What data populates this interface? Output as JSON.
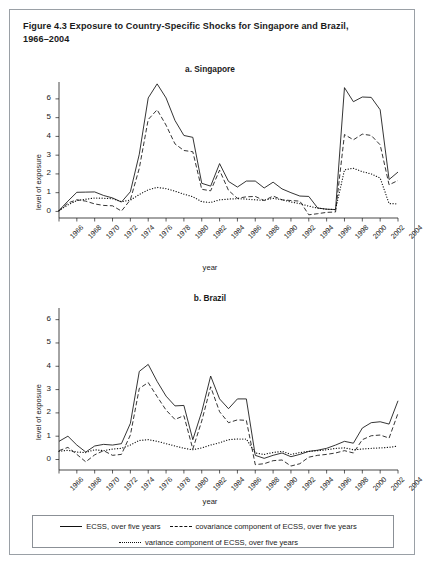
{
  "figure": {
    "title": "Figure 4.3  Exposure to Country-Specific Shocks for Singapore and Brazil, 1966–2004",
    "title_line1": "Figure 4.3  Exposure to Country-Specific Shocks for Singapore and Brazil,",
    "title_line2": "1966–2004"
  },
  "axis": {
    "xlabel": "year",
    "ylabel": "level of exposure",
    "yticks": [
      0,
      1,
      2,
      3,
      4,
      5,
      6
    ],
    "xticks": [
      1966,
      1968,
      1970,
      1972,
      1974,
      1976,
      1978,
      1980,
      1982,
      1984,
      1986,
      1988,
      1990,
      1992,
      1994,
      1996,
      1998,
      2000,
      2002,
      2004
    ]
  },
  "legend": {
    "items": [
      {
        "label": "ECSS, over five years",
        "style": "solid"
      },
      {
        "label": "covariance component of ECSS, over five years",
        "style": "dashed"
      },
      {
        "label": "variance component of ECSS, over five years",
        "style": "dotted"
      }
    ]
  },
  "chart_data": [
    {
      "type": "line",
      "title": "a. Singapore",
      "xlabel": "year",
      "ylabel": "level of exposure",
      "xlim": [
        1966,
        2004
      ],
      "ylim": [
        -0.35,
        6.9
      ],
      "grid": false,
      "legend_position": "below-figure",
      "x": [
        1966,
        1967,
        1968,
        1969,
        1970,
        1971,
        1972,
        1973,
        1974,
        1975,
        1976,
        1977,
        1978,
        1979,
        1980,
        1981,
        1982,
        1983,
        1984,
        1985,
        1986,
        1987,
        1988,
        1989,
        1990,
        1991,
        1992,
        1993,
        1994,
        1995,
        1996,
        1997,
        1998,
        1999,
        2000,
        2001,
        2002,
        2003,
        2004
      ],
      "series": [
        {
          "name": "ECSS, over five years",
          "style": "solid",
          "values": [
            0.05,
            0.55,
            1.02,
            1.03,
            1.04,
            0.85,
            0.72,
            0.5,
            1.05,
            3.05,
            6.05,
            6.8,
            6.05,
            4.85,
            4.05,
            3.95,
            1.5,
            1.35,
            2.55,
            1.6,
            1.3,
            1.62,
            1.62,
            1.25,
            1.56,
            1.2,
            1.0,
            0.82,
            0.8,
            0.18,
            0.12,
            0.1,
            6.6,
            5.85,
            6.1,
            6.08,
            5.42,
            1.7,
            2.1
          ]
        },
        {
          "name": "covariance component of ECSS, over five years",
          "style": "dashed",
          "values": [
            0.02,
            0.45,
            0.62,
            0.55,
            0.4,
            0.32,
            0.3,
            0.02,
            0.62,
            2.3,
            4.9,
            5.42,
            4.6,
            3.6,
            3.25,
            3.18,
            1.18,
            1.1,
            2.2,
            1.12,
            0.7,
            0.78,
            0.8,
            0.58,
            0.82,
            0.62,
            0.58,
            0.55,
            -0.18,
            -0.12,
            -0.05,
            -0.03,
            4.1,
            3.82,
            4.12,
            4.05,
            3.55,
            1.42,
            1.65
          ]
        },
        {
          "name": "variance component of ECSS, over five years",
          "style": "dotted",
          "values": [
            0.05,
            0.35,
            0.58,
            0.65,
            0.72,
            0.7,
            0.68,
            0.52,
            0.6,
            0.9,
            1.15,
            1.28,
            1.22,
            1.08,
            0.92,
            0.78,
            0.52,
            0.48,
            0.62,
            0.66,
            0.68,
            0.66,
            0.62,
            0.6,
            0.7,
            0.62,
            0.5,
            0.42,
            0.28,
            0.18,
            0.12,
            0.1,
            2.22,
            2.3,
            2.12,
            2.0,
            1.78,
            0.42,
            0.4
          ]
        }
      ]
    },
    {
      "type": "line",
      "title": "b. Brazil",
      "xlabel": "year",
      "ylabel": "level of exposure",
      "xlim": [
        1966,
        2004
      ],
      "ylim": [
        -0.45,
        6.5
      ],
      "grid": false,
      "legend_position": "below-figure",
      "x": [
        1966,
        1967,
        1968,
        1969,
        1970,
        1971,
        1972,
        1973,
        1974,
        1975,
        1976,
        1977,
        1978,
        1979,
        1980,
        1981,
        1982,
        1983,
        1984,
        1985,
        1986,
        1987,
        1988,
        1989,
        1990,
        1991,
        1992,
        1993,
        1994,
        1995,
        1996,
        1997,
        1998,
        1999,
        2000,
        2001,
        2002,
        2003,
        2004
      ],
      "series": [
        {
          "name": "ECSS, over five years",
          "style": "solid",
          "values": [
            0.78,
            1.0,
            0.62,
            0.32,
            0.58,
            0.65,
            0.62,
            0.68,
            1.55,
            3.78,
            4.08,
            3.35,
            2.72,
            2.3,
            2.32,
            0.85,
            2.05,
            3.58,
            2.6,
            2.18,
            2.6,
            2.6,
            0.18,
            0.05,
            0.18,
            0.28,
            0.12,
            0.22,
            0.35,
            0.4,
            0.48,
            0.62,
            0.78,
            0.7,
            1.35,
            1.58,
            1.62,
            1.52,
            2.52
          ]
        },
        {
          "name": "covariance component of ECSS, over five years",
          "style": "dashed",
          "values": [
            0.38,
            0.52,
            0.22,
            -0.1,
            0.2,
            0.38,
            0.18,
            0.22,
            1.05,
            3.05,
            3.3,
            2.7,
            2.12,
            1.72,
            1.88,
            0.45,
            1.65,
            3.12,
            2.05,
            1.58,
            1.7,
            1.68,
            -0.22,
            -0.18,
            -0.05,
            -0.02,
            -0.28,
            -0.18,
            0.1,
            0.18,
            0.22,
            0.28,
            0.38,
            0.28,
            0.85,
            1.02,
            1.05,
            0.92,
            1.98
          ]
        },
        {
          "name": "variance component of ECSS, over five years",
          "style": "dotted",
          "values": [
            0.35,
            0.4,
            0.32,
            0.3,
            0.42,
            0.38,
            0.45,
            0.48,
            0.62,
            0.82,
            0.85,
            0.78,
            0.68,
            0.58,
            0.48,
            0.42,
            0.5,
            0.62,
            0.72,
            0.85,
            0.88,
            0.88,
            0.28,
            0.22,
            0.3,
            0.35,
            0.22,
            0.3,
            0.35,
            0.38,
            0.42,
            0.48,
            0.5,
            0.42,
            0.45,
            0.48,
            0.5,
            0.52,
            0.58
          ]
        }
      ]
    }
  ]
}
